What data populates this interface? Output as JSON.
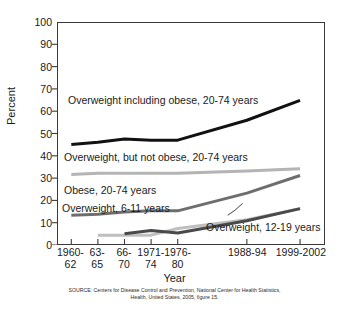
{
  "chart_data": {
    "type": "line",
    "title": "",
    "xlabel": "Year",
    "ylabel": "Percent",
    "ylim": [
      0,
      100
    ],
    "grid": false,
    "legend_position": "in-plot-labels",
    "categories": [
      "1960-62",
      "63-65",
      "66-70",
      "1971-74",
      "1976-80",
      "1988-94",
      "1999-2002"
    ],
    "x_positions": [
      0.5,
      1.5,
      2.5,
      3.5,
      4.5,
      7.1,
      9.1
    ],
    "y_ticks": [
      0,
      10,
      20,
      30,
      40,
      50,
      60,
      70,
      80,
      90,
      100
    ],
    "series": [
      {
        "name": "Overweight including obese, 20-74 years",
        "color": "#111111",
        "width": 3.0,
        "x": [
          "1960-62",
          "63-65",
          "66-70",
          "1971-74",
          "1976-80",
          "1988-94",
          "1999-2002"
        ],
        "values": [
          45,
          46,
          47.5,
          47,
          47,
          56,
          65
        ]
      },
      {
        "name": "Overweight, but not obese, 20-74 years",
        "color": "#b4b4b4",
        "width": 3.0,
        "x": [
          "1960-62",
          "63-65",
          "66-70",
          "1971-74",
          "1976-80",
          "1988-94",
          "1999-2002"
        ],
        "values": [
          31.5,
          32,
          32,
          32,
          32,
          33,
          34
        ]
      },
      {
        "name": "Obese, 20-74 years",
        "color": "#6e6e6e",
        "width": 3.0,
        "x": [
          "1960-62",
          "63-65",
          "66-70",
          "1971-74",
          "1976-80",
          "1988-94",
          "1999-2002"
        ],
        "values": [
          13,
          13.5,
          14.5,
          15,
          15,
          23,
          31
        ]
      },
      {
        "name": "Overweight, 6-11 years",
        "color": "#bfbfbf",
        "width": 3.0,
        "x": [
          "63-65",
          "66-70",
          "1971-74",
          "1976-80",
          "1988-94",
          "1999-2002"
        ],
        "values": [
          4,
          4,
          4,
          7,
          11,
          16
        ]
      },
      {
        "name": "Overweight, 12-19 years",
        "color": "#4a4a4a",
        "width": 3.0,
        "x": [
          "66-70",
          "1971-74",
          "1976-80",
          "1988-94",
          "1999-2002"
        ],
        "values": [
          4.6,
          6.1,
          5,
          10.5,
          16
        ]
      }
    ],
    "annotations": [
      {
        "text": "Overweight including obese, 20-74 years",
        "x_px": 68,
        "y_px": 95
      },
      {
        "text": "Overweight, but not obese, 20-74 years",
        "x_px": 64,
        "y_px": 152
      },
      {
        "text": "Obese, 20-74 years",
        "x_px": 64,
        "y_px": 185
      },
      {
        "text": "Overweight, 6-11 years",
        "x_px": 62,
        "y_px": 203
      },
      {
        "text": "Overweight, 12-19 years",
        "x_px": 206,
        "y_px": 222
      }
    ]
  },
  "axis": {
    "y_title": "Percent",
    "x_title": "Year",
    "y_tick_labels": [
      "100",
      "90",
      "80",
      "70",
      "60",
      "50",
      "40",
      "30",
      "20",
      "10",
      "0"
    ],
    "x_tick_labels": [
      {
        "line1": "1960-",
        "line2": "62"
      },
      {
        "line1": "63-",
        "line2": "65"
      },
      {
        "line1": "66-",
        "line2": "70"
      },
      {
        "line1": "1971-",
        "line2": "74"
      },
      {
        "line1": "1976-",
        "line2": "80"
      },
      {
        "line1": "1988-94",
        "line2": ""
      },
      {
        "line1": "1999-2002",
        "line2": ""
      }
    ]
  },
  "source_note": {
    "line1": "SOURCE: Centers for Disease Control and Prevention, National Center for Health Statistics,",
    "line2": "Health, United States, 2005, figure 15."
  }
}
